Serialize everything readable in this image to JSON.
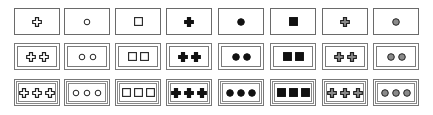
{
  "diagram": {
    "rows": 3,
    "columns": 8,
    "row_counts": [
      1,
      2,
      3
    ],
    "row_borders": [
      "single",
      "double",
      "triple"
    ],
    "column_shapes": [
      {
        "shape": "cross",
        "fill": "open"
      },
      {
        "shape": "circle",
        "fill": "open"
      },
      {
        "shape": "square",
        "fill": "open"
      },
      {
        "shape": "cross",
        "fill": "filled"
      },
      {
        "shape": "circle",
        "fill": "filled"
      },
      {
        "shape": "square",
        "fill": "filled"
      },
      {
        "shape": "cross",
        "fill": "gray"
      },
      {
        "shape": "circle",
        "fill": "gray"
      }
    ],
    "colors": {
      "stroke": "#222222",
      "filled": "#111111",
      "gray": "#8a8a8a",
      "border": "#777777"
    }
  }
}
